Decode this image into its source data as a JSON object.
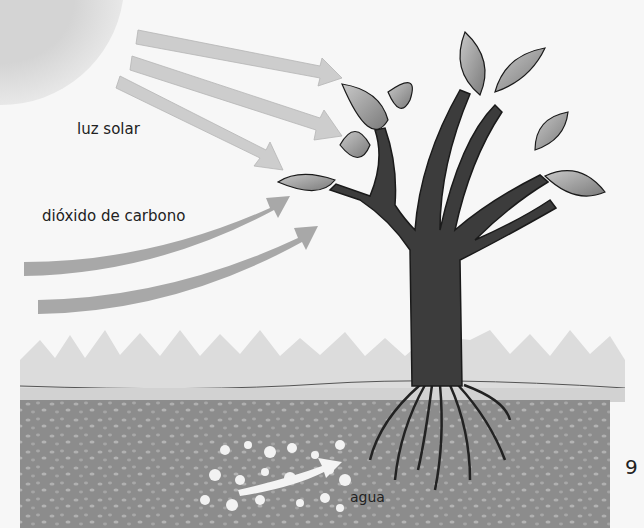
{
  "diagram": {
    "title": "",
    "labels": {
      "sunlight": "luz solar",
      "co2": "dióxido de carbono",
      "water": "agua"
    },
    "page_number": "9",
    "elements": [
      "sun",
      "sunlight-arrows",
      "co2-arrows",
      "tree",
      "leaves",
      "roots",
      "grass",
      "soil",
      "water-droplets",
      "water-arrow"
    ],
    "colors": {
      "background": "#f7f7f7",
      "sun": "#d9d9d9",
      "light_arrow": "#cfcfcf",
      "co2_arrow": "#a6a6a6",
      "trunk": "#3c3c3c",
      "leaf": "#9a9a9a",
      "grass": "#dcdcdc",
      "soil": "#8a8a8a",
      "water": "#f0f0f0"
    }
  }
}
